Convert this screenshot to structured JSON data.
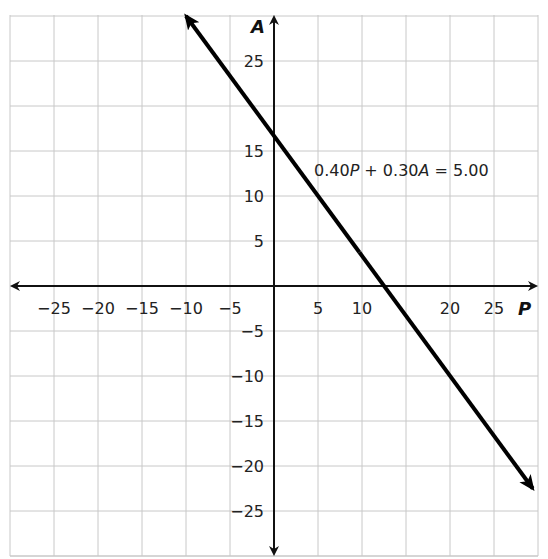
{
  "chart_data": {
    "type": "line",
    "title": "",
    "xlabel": "P",
    "ylabel": "A",
    "xlim": [
      -30,
      30
    ],
    "ylim": [
      -30,
      30
    ],
    "grid": true,
    "grid_step": 5,
    "x_ticks": [
      -25,
      -20,
      -15,
      -10,
      -5,
      5,
      10,
      20,
      25
    ],
    "y_ticks": [
      25,
      15,
      10,
      5,
      -5,
      -10,
      -15,
      -20,
      -25
    ],
    "x_tick_labels": [
      "−25",
      "−20",
      "−15",
      "−10",
      "−5",
      "5",
      "10",
      "20",
      "25"
    ],
    "y_tick_labels": [
      "25",
      "15",
      "10",
      "5",
      "−5",
      "−10",
      "−15",
      "−20",
      "−25"
    ],
    "series": [
      {
        "name": "0.40P + 0.30A = 5.00",
        "equation": {
          "a": 0.4,
          "b": 0.3,
          "c": 5.0
        },
        "x": [
          -10,
          0,
          12.5,
          29.4
        ],
        "y": [
          30,
          16.67,
          0,
          -22.5
        ],
        "intercepts": {
          "P": 12.5,
          "A": 16.67
        },
        "arrows": "both"
      }
    ],
    "annotations": [
      {
        "text": "0.40P + 0.30A = 5.00",
        "x": 5,
        "y": 12.5
      }
    ],
    "axes_arrows": "both"
  },
  "labels": {
    "x_axis": "P",
    "y_axis": "A",
    "equation_parts": [
      "0.40",
      "P",
      " + 0.30",
      "A",
      " = 5.00"
    ]
  },
  "colors": {
    "grid": "#c8c8c8",
    "axis": "#111111",
    "line": "#000000",
    "text": "#222222"
  }
}
